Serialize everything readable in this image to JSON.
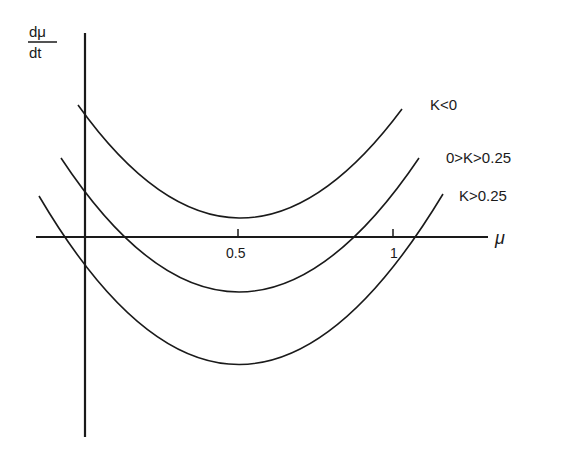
{
  "figure": {
    "y_axis_label": {
      "numerator": "dμ",
      "denominator": "dt"
    },
    "x_axis_label": "μ",
    "x_ticks": [
      {
        "label": "0.5",
        "value": 0.5
      },
      {
        "label": "1",
        "value": 1
      }
    ],
    "curves": [
      {
        "label": "K<0",
        "description": "parabola with minimum above axis"
      },
      {
        "label": "0>K>0.25",
        "description": "parabola crossing axis twice between 0 and 1"
      },
      {
        "label": "K>0.25",
        "description": "parabola crossing axis twice outside 0..1"
      }
    ],
    "color": "#1a1a1a"
  }
}
